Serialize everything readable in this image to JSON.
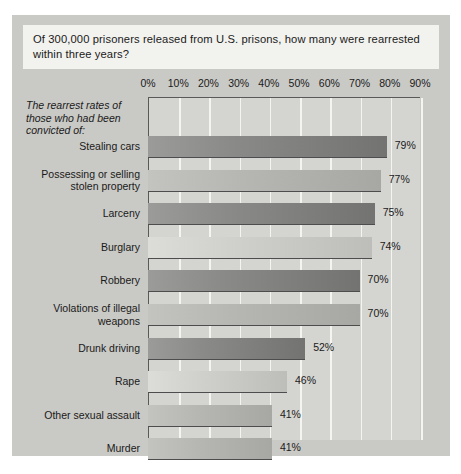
{
  "title": {
    "text": "Of 300,000 prisoners released from U.S. prisons, how many were rearrested within three years?"
  },
  "y_caption": "The rearrest rates of those who had been convicted of:",
  "colors": {
    "panel": "#c9c9c5",
    "plot": "#d4d4d0",
    "title_box": "#f2f2ee",
    "gridline": "#f4f4f0",
    "axis": "#59595a",
    "bar_dark": "#8a8a88",
    "bar_light": "#b6b6b3",
    "bar_pale": "#cfcfcc",
    "text": "#1a1a1a"
  },
  "chart_data": {
    "type": "bar",
    "orientation": "horizontal",
    "title": "Of 300,000 prisoners released from U.S. prisons, how many were rearrested within three years?",
    "xlabel": "",
    "ylabel": "The rearrest rates of those who had been convicted of:",
    "xlim": [
      0,
      90
    ],
    "xticks": [
      0,
      10,
      20,
      30,
      40,
      50,
      60,
      70,
      80,
      90
    ],
    "xticklabels": [
      "0%",
      "10%",
      "20%",
      "30%",
      "40%",
      "50%",
      "60%",
      "70%",
      "80%",
      "90%"
    ],
    "grid": true,
    "legend": false,
    "value_suffix": "%",
    "categories": [
      "Stealing cars",
      "Possessing or selling stolen property",
      "Larceny",
      "Burglary",
      "Robbery",
      "Violations of illegal weapons",
      "Drunk driving",
      "Rape",
      "Other sexual assault",
      "Murder"
    ],
    "values": [
      79,
      77,
      75,
      74,
      70,
      70,
      52,
      46,
      41,
      41
    ],
    "value_labels": [
      "79%",
      "77%",
      "75%",
      "74%",
      "70%",
      "70%",
      "52%",
      "46%",
      "41%",
      "41%"
    ],
    "bar_shades": [
      "dark",
      "light",
      "dark",
      "pale",
      "dark",
      "light",
      "dark",
      "pale",
      "light",
      "light"
    ]
  }
}
